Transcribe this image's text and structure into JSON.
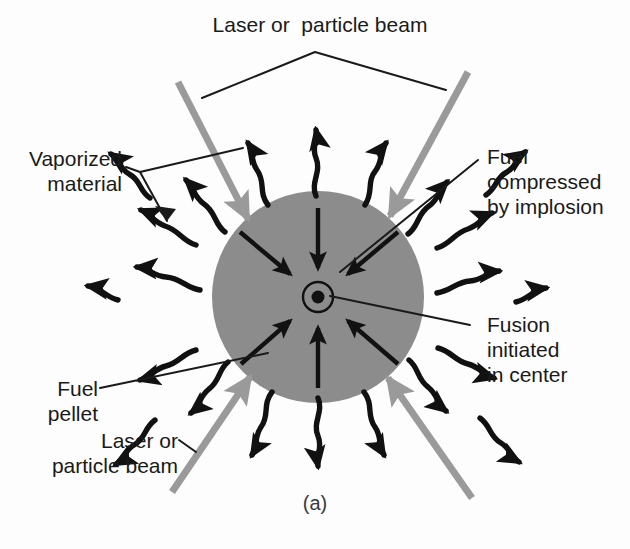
{
  "figure": {
    "caption": "(a)",
    "type": "inertial-confinement-fusion-schematic"
  },
  "labels": {
    "top_beam": "Laser or  particle beam",
    "vaporized_material_line1": "Vaporized",
    "vaporized_material_line2": "material",
    "fuel_compressed_line1": "Fuel",
    "fuel_compressed_line2": "compressed",
    "fuel_compressed_line3": "by implosion",
    "fusion_initiated_line1": "Fusion",
    "fusion_initiated_line2": "initiated",
    "fusion_initiated_line3": "in center",
    "fuel_pellet_line1": "Fuel",
    "fuel_pellet_line2": "pellet",
    "bottom_beam_line1": "Laser or",
    "bottom_beam_line2": "particle beam"
  },
  "colors": {
    "background": "#fdfdfd",
    "pellet_fill": "#8c8c8c",
    "beam_gray": "#9a9a9a",
    "ink_black": "#111111",
    "caption_gray": "#3a3a3a"
  },
  "geometry": {
    "pellet_center_x": 318,
    "pellet_center_y": 297,
    "pellet_radius": 106,
    "core_circle_radius": 15,
    "core_dot_radius": 6,
    "implosion_arrow_count": 6,
    "beam_count": 4,
    "vapor_arrow_count": 14
  }
}
